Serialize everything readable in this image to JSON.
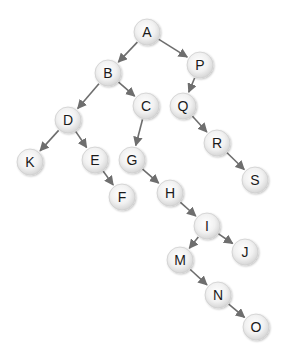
{
  "diagram": {
    "type": "tree",
    "colors": {
      "background": "#ffffff",
      "edge": "#6e6e6e",
      "node_fill_center": "#ffffff",
      "node_fill_edge": "#d8d8d8",
      "node_stroke": "#cfcfcf",
      "label": "#1a1a1a"
    },
    "node_radius": 13,
    "nodes": [
      {
        "id": "A",
        "label": "A",
        "x": 147,
        "y": 32
      },
      {
        "id": "B",
        "label": "B",
        "x": 108,
        "y": 73
      },
      {
        "id": "P",
        "label": "P",
        "x": 200,
        "y": 65
      },
      {
        "id": "C",
        "label": "C",
        "x": 146,
        "y": 106
      },
      {
        "id": "D",
        "label": "D",
        "x": 68,
        "y": 120
      },
      {
        "id": "Q",
        "label": "Q",
        "x": 183,
        "y": 106
      },
      {
        "id": "K",
        "label": "K",
        "x": 30,
        "y": 162
      },
      {
        "id": "E",
        "label": "E",
        "x": 95,
        "y": 160
      },
      {
        "id": "G",
        "label": "G",
        "x": 132,
        "y": 160
      },
      {
        "id": "R",
        "label": "R",
        "x": 217,
        "y": 143
      },
      {
        "id": "F",
        "label": "F",
        "x": 122,
        "y": 197
      },
      {
        "id": "H",
        "label": "H",
        "x": 170,
        "y": 193
      },
      {
        "id": "S",
        "label": "S",
        "x": 255,
        "y": 180
      },
      {
        "id": "I",
        "label": "I",
        "x": 207,
        "y": 226
      },
      {
        "id": "J",
        "label": "J",
        "x": 245,
        "y": 252
      },
      {
        "id": "M",
        "label": "M",
        "x": 180,
        "y": 260
      },
      {
        "id": "N",
        "label": "N",
        "x": 218,
        "y": 295
      },
      {
        "id": "O",
        "label": "O",
        "x": 256,
        "y": 327
      }
    ],
    "edges": [
      {
        "from": "A",
        "to": "B"
      },
      {
        "from": "A",
        "to": "P"
      },
      {
        "from": "B",
        "to": "D"
      },
      {
        "from": "B",
        "to": "C"
      },
      {
        "from": "D",
        "to": "K"
      },
      {
        "from": "D",
        "to": "E"
      },
      {
        "from": "E",
        "to": "F"
      },
      {
        "from": "C",
        "to": "G"
      },
      {
        "from": "G",
        "to": "H"
      },
      {
        "from": "H",
        "to": "I"
      },
      {
        "from": "I",
        "to": "M"
      },
      {
        "from": "I",
        "to": "J"
      },
      {
        "from": "M",
        "to": "N"
      },
      {
        "from": "N",
        "to": "O"
      },
      {
        "from": "P",
        "to": "Q"
      },
      {
        "from": "Q",
        "to": "R"
      },
      {
        "from": "R",
        "to": "S"
      }
    ]
  }
}
